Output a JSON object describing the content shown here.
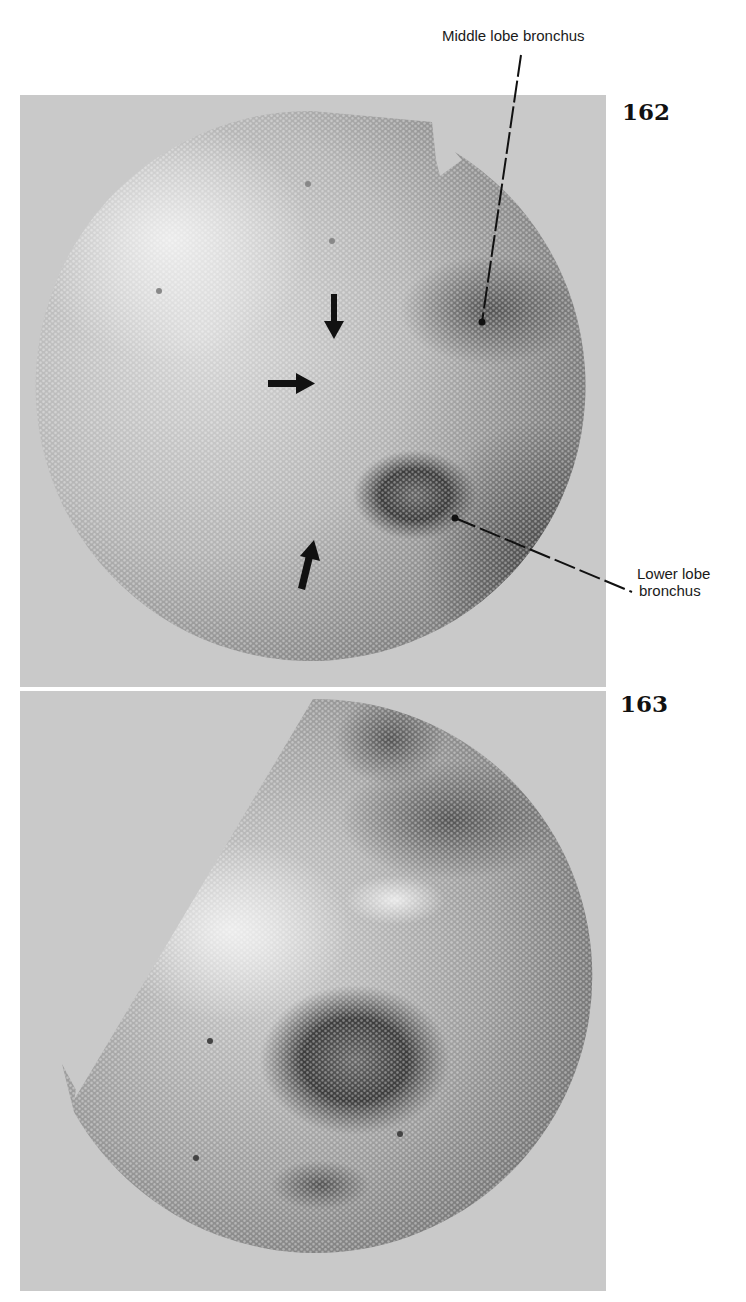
{
  "figures": [
    {
      "number": "162",
      "panel": {
        "x": 20,
        "y": 95,
        "w": 586,
        "h": 592
      },
      "circle": {
        "cx": 312,
        "cy": 386,
        "r": 275
      },
      "tone": {
        "light": "#d8d8d8",
        "mid": "#a8a8a8",
        "dark": "#5a5a5a"
      },
      "arrows": [
        {
          "direction": "down",
          "x": 333,
          "y": 296
        },
        {
          "direction": "right",
          "x": 270,
          "y": 384
        },
        {
          "direction": "up-right",
          "x": 302,
          "y": 560
        }
      ],
      "annotations": [
        {
          "text": "Middle lobe bronchus",
          "label_x": 442,
          "label_y": 27,
          "line": [
            [
              521,
              55
            ],
            [
              482,
              322
            ]
          ],
          "dot": [
            482,
            322
          ]
        },
        {
          "text_lines": [
            "Lower lobe",
            "bronchus"
          ],
          "label_x": 637,
          "label_y": 565,
          "line": [
            [
              455,
              518
            ],
            [
              632,
              592
            ]
          ],
          "dot": [
            455,
            518
          ]
        }
      ]
    },
    {
      "number": "163",
      "panel": {
        "x": 20,
        "y": 691,
        "w": 586,
        "h": 600
      },
      "circle": {
        "cx": 313,
        "cy": 976,
        "r": 277
      },
      "tone": {
        "light": "#d5d5d5",
        "mid": "#9a9a9a",
        "dark": "#4a4a4a"
      }
    }
  ],
  "labels": {
    "fig162": "162",
    "fig163": "163",
    "middle_lobe": "Middle lobe bronchus",
    "lower_lobe_1": "Lower lobe",
    "lower_lobe_2": "bronchus"
  }
}
